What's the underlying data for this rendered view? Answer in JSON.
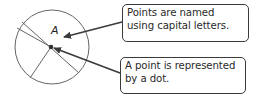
{
  "diagram": {
    "point_label": "A",
    "callouts": [
      {
        "lines": [
          "Points are named",
          "using capital letters."
        ]
      },
      {
        "lines": [
          "A point is represented",
          "by a dot."
        ]
      }
    ],
    "colors": {
      "stroke": "#555555",
      "arrow": "#3a3a3a",
      "text": "#2a2a2a"
    }
  }
}
